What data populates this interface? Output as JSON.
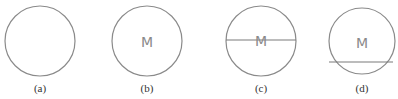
{
  "figures": [
    {
      "id": "a",
      "caption": "(a)",
      "cx": 40,
      "cy": 41,
      "r": 35,
      "letter": "",
      "line": null
    },
    {
      "id": "b",
      "caption": "(b)",
      "cx": 147,
      "cy": 41,
      "r": 35,
      "letter": "M",
      "line": null
    },
    {
      "id": "c",
      "caption": "(c)",
      "cx": 261,
      "cy": 41,
      "r": 35,
      "letter": "M",
      "line": {
        "x1": 226,
        "x2": 296,
        "y": 40
      }
    },
    {
      "id": "d",
      "caption": "(d)",
      "cx": 362,
      "cy": 41,
      "r": 33,
      "letter": "M",
      "line": {
        "x1": 329,
        "x2": 393,
        "y": 62
      }
    }
  ],
  "colors": {
    "stroke": "#8a8a8a",
    "caption": "#333333"
  }
}
